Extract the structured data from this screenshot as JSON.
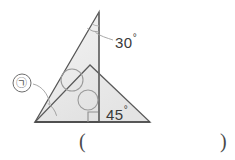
{
  "figure": {
    "name": "geometry-two-triangles",
    "background_color": "#ffffff",
    "stroke_color": "#4d4d4d",
    "fill_color_outer": "#ebebeb",
    "fill_color_inner": "#e2e2e2",
    "leader_color": "#8a8a8a",
    "arc_color": "#9a9a9a"
  },
  "labels": {
    "angle_top": "30",
    "angle_top_degree": "°",
    "angle_bottom_right": "45",
    "angle_bottom_right_degree": "°",
    "marked_angle": "㉠"
  },
  "answer_field": {
    "paren_open": "(",
    "paren_close": ")",
    "value": ""
  },
  "geometry": {
    "points": {
      "tall_apex": [
        99,
        12
      ],
      "base_left": [
        35,
        122
      ],
      "base_right": [
        150,
        122
      ],
      "inner_apex": [
        90,
        65
      ],
      "foot": [
        99,
        122
      ]
    },
    "vertical_line": [
      [
        99,
        12
      ],
      [
        99,
        122
      ]
    ],
    "right_angle_mark": {
      "x": 88,
      "y": 111,
      "size": 10
    },
    "circles": [
      {
        "cx": 72,
        "cy": 80,
        "r": 11
      },
      {
        "cx": 88,
        "cy": 100,
        "r": 10
      }
    ],
    "arcs": {
      "top_angle_arc": {
        "cx": 99,
        "cy": 12,
        "r": 20
      },
      "bottom_left_arc": {
        "cx": 35,
        "cy": 122,
        "r": 22
      }
    },
    "leaders": [
      {
        "from": [
          113,
          40
        ],
        "to": [
          95,
          33
        ]
      },
      {
        "from": [
          32,
          84
        ],
        "to": [
          48,
          104
        ]
      }
    ]
  }
}
